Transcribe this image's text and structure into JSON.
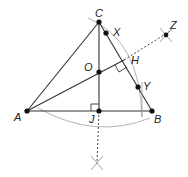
{
  "diagram": {
    "points": {
      "A": {
        "label": "A",
        "x": 27,
        "y": 111
      },
      "B": {
        "label": "B",
        "x": 152,
        "y": 111
      },
      "C": {
        "label": "C",
        "x": 99,
        "y": 22
      },
      "O": {
        "label": "O",
        "x": 99,
        "y": 72
      },
      "J": {
        "label": "J",
        "x": 99,
        "y": 111
      },
      "H": {
        "label": "H",
        "x": 124,
        "y": 60
      },
      "X": {
        "label": "X",
        "x": 106,
        "y": 33
      },
      "Y": {
        "label": "Y",
        "x": 138,
        "y": 87
      },
      "Z": {
        "label": "Z",
        "x": 166,
        "y": 35
      }
    },
    "colors": {
      "line": "#333333",
      "arc": "#9a9a9a",
      "point": "#111111",
      "construction": "#555555"
    }
  }
}
